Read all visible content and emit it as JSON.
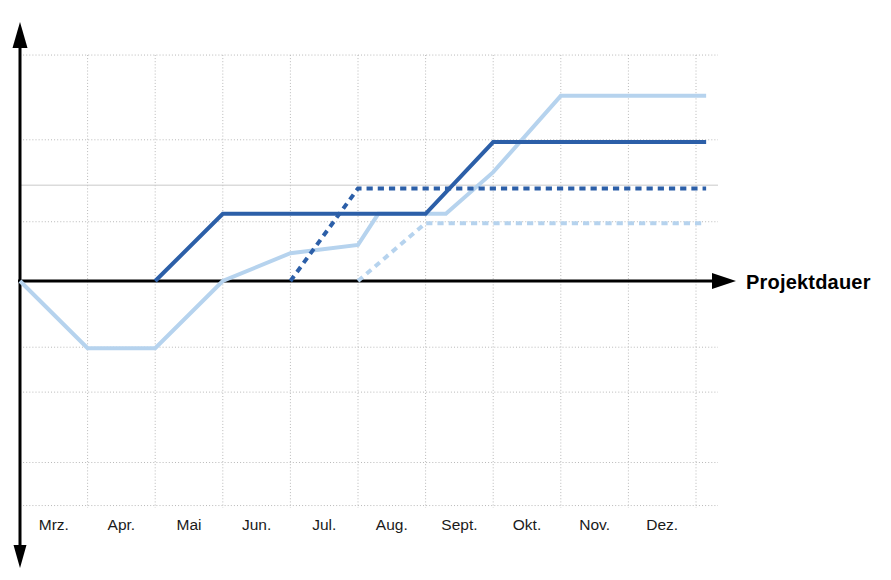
{
  "chart_data": {
    "type": "line",
    "title": "",
    "subtitle": "",
    "xlabel": "Projektdauer",
    "ylabel": "",
    "categories": [
      "Mrz.",
      "Apr.",
      "Mai",
      "Jun.",
      "Jul.",
      "Aug.",
      "Sept.",
      "Okt.",
      "Nov.",
      "Dez."
    ],
    "x_tick_labels": [
      "Mrz.",
      "Apr.",
      "Mai",
      "Jun.",
      "Jul.",
      "Aug.",
      "Sept.",
      "Okt.",
      "Nov.",
      "Dez."
    ],
    "y_tick_labels": [],
    "xlim": [
      0,
      10
    ],
    "ylim": [
      -3,
      5
    ],
    "grid": true,
    "legend": "none",
    "zero_line": true,
    "annotations": [],
    "axis_arrow_x": true,
    "axis_arrow_y": true,
    "colors": {
      "dark_blue": "#2C5FA8",
      "light_blue": "#B6D3EE",
      "axis": "#000000",
      "grid": "#b9b9b9",
      "background": "#ffffff"
    },
    "series": [
      {
        "name": "dunkelblau-durchgezogen",
        "color": "#2C5FA8",
        "style": "solid",
        "width": 4,
        "x": [
          2.0,
          3.0,
          6.0,
          7.0,
          10.15
        ],
        "y": [
          0.0,
          1.45,
          1.45,
          3.0,
          3.0
        ]
      },
      {
        "name": "dunkelblau-gestrichelt",
        "color": "#2C5FA8",
        "style": "dashed",
        "width": 4,
        "x": [
          4.0,
          5.0,
          10.15
        ],
        "y": [
          0.0,
          2.0,
          2.0
        ]
      },
      {
        "name": "hellblau-durchgezogen",
        "color": "#B6D3EE",
        "style": "solid",
        "width": 4,
        "x": [
          0.0,
          1.0,
          2.0,
          3.0,
          4.0,
          5.0,
          5.3,
          6.3,
          7.0,
          8.0,
          10.15
        ],
        "y": [
          0.0,
          -1.45,
          -1.45,
          0.0,
          0.6,
          0.78,
          1.45,
          1.45,
          2.35,
          4.0,
          4.0
        ]
      },
      {
        "name": "hellblau-gestrichelt",
        "color": "#B6D3EE",
        "style": "dashed",
        "width": 4,
        "x": [
          5.0,
          6.0,
          10.15
        ],
        "y": [
          0.0,
          1.25,
          1.25
        ]
      }
    ]
  },
  "axis": {
    "x_label": "Projektdauer"
  }
}
